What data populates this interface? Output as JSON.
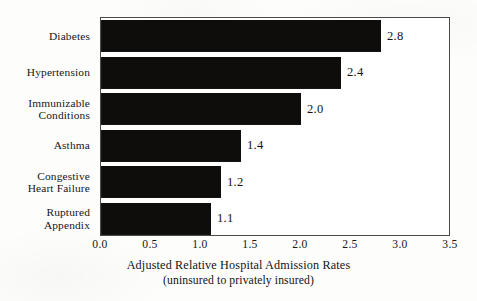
{
  "chart_data": {
    "type": "bar",
    "orientation": "horizontal",
    "title": "",
    "xlabel_line1": "Adjusted Relative Hospital Admission Rates",
    "xlabel_line2": "(uninsured to privately insured)",
    "ylabel": "",
    "xlim": [
      0.0,
      3.5
    ],
    "grid": false,
    "legend": "none",
    "categories": [
      "Diabetes",
      "Hypertension",
      "Immunizable Conditions",
      "Asthma",
      "Congestive Heart Failure",
      "Ruptured Appendix"
    ],
    "category_lines": [
      [
        "Diabetes"
      ],
      [
        "Hypertension"
      ],
      [
        "Immunizable",
        "Conditions"
      ],
      [
        "Asthma"
      ],
      [
        "Congestive",
        "Heart Failure"
      ],
      [
        "Ruptured",
        "Appendix"
      ]
    ],
    "values": [
      2.8,
      2.4,
      2.0,
      1.4,
      1.2,
      1.1
    ],
    "value_labels": [
      "2.8",
      "2.4",
      "2.0",
      "1.4",
      "1.2",
      "1.1"
    ],
    "xticks": [
      0.0,
      0.5,
      1.0,
      1.5,
      2.0,
      2.5,
      3.0,
      3.5
    ],
    "xtick_labels": [
      "0.0",
      "0.5",
      "1.0",
      "1.5",
      "2.0",
      "2.5",
      "3.0",
      "3.5"
    ],
    "bar_color": "#0e0d0c",
    "frame_color": "#4a4a4a",
    "background_color": "#fdfdfc"
  }
}
